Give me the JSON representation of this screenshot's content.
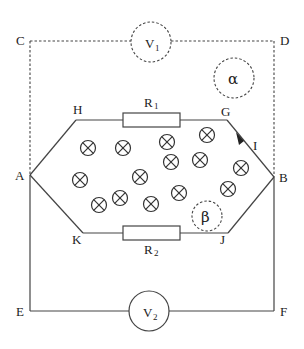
{
  "diagram": {
    "type": "electric circuit in magnetic field",
    "nodes": {
      "A": "A",
      "B": "B",
      "C": "C",
      "D": "D",
      "E": "E",
      "F": "F",
      "G": "G",
      "H": "H",
      "J": "J",
      "K": "K"
    },
    "components": {
      "voltmeter1": {
        "letter": "V",
        "sub": "1"
      },
      "voltmeter2": {
        "letter": "V",
        "sub": "2"
      },
      "resistor1": {
        "letter": "R",
        "sub": "1"
      },
      "resistor2": {
        "letter": "R",
        "sub": "2"
      }
    },
    "current_label": "I",
    "regions": {
      "alpha": "α",
      "beta": "β"
    },
    "field_symbol": "⊗",
    "field_points": [
      [
        88,
        148
      ],
      [
        123,
        148
      ],
      [
        167,
        142
      ],
      [
        207,
        135
      ],
      [
        171,
        162
      ],
      [
        200,
        160
      ],
      [
        241,
        168
      ],
      [
        80,
        180
      ],
      [
        140,
        177
      ],
      [
        228,
        189
      ],
      [
        179,
        193
      ],
      [
        120,
        198
      ],
      [
        99,
        205
      ],
      [
        151,
        204
      ]
    ]
  }
}
